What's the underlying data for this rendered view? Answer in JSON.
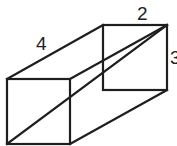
{
  "diagram": {
    "type": "rectangular-prism",
    "labels": {
      "length": "4",
      "width": "2",
      "height": "3"
    },
    "colors": {
      "stroke": "#1e1e1e",
      "text": "#222222",
      "background": "#ffffff"
    }
  }
}
